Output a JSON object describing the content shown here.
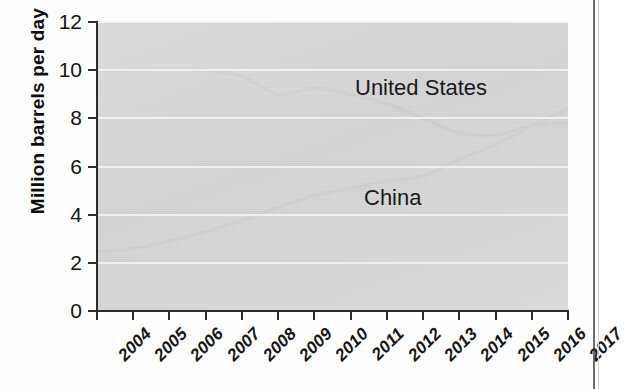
{
  "chart_data": {
    "type": "line",
    "title": "",
    "subtitle": "",
    "xlabel": "",
    "ylabel": "Million barrels per day",
    "categories": [
      "2004",
      "2005",
      "2006",
      "2007",
      "2008",
      "2009",
      "2010",
      "2011",
      "2012",
      "2013",
      "2014",
      "2015",
      "2016",
      "2017"
    ],
    "x": [
      2004,
      2005,
      2006,
      2007,
      2008,
      2009,
      2010,
      2011,
      2012,
      2013,
      2014,
      2015,
      2016,
      2017
    ],
    "xlim": [
      2004,
      2017
    ],
    "ylim": [
      0,
      12
    ],
    "yticks": [
      0,
      2,
      4,
      6,
      8,
      10,
      12
    ],
    "grid": "horizontal",
    "legend_position": "inline-annotation",
    "series": [
      {
        "name": "United States",
        "color": "#6e6e6e",
        "values": [
          10.0,
          10.0,
          10.05,
          10.0,
          9.75,
          9.0,
          9.25,
          9.0,
          8.6,
          8.0,
          7.4,
          7.3,
          7.7,
          7.8
        ]
      },
      {
        "name": "China",
        "color": "#6e6e6e",
        "values": [
          2.45,
          2.6,
          2.9,
          3.3,
          3.75,
          4.3,
          4.8,
          5.1,
          5.4,
          5.6,
          6.3,
          6.9,
          7.7,
          8.4
        ]
      }
    ],
    "annotations": [
      {
        "text": "United States",
        "x": 2011.1,
        "y": 9.6
      },
      {
        "text": "China",
        "x": 2011.4,
        "y": 4.7
      }
    ]
  },
  "axis": {
    "y_title": "Million barrels per day",
    "y_tick_labels": [
      "0",
      "2",
      "4",
      "6",
      "8",
      "10",
      "12"
    ],
    "x_tick_labels": [
      "2004",
      "2005",
      "2006",
      "2007",
      "2008",
      "2009",
      "2010",
      "2011",
      "2012",
      "2013",
      "2014",
      "2015",
      "2016",
      "2017"
    ]
  },
  "labels": {
    "united_states": "United States",
    "china": "China"
  },
  "colors": {
    "plot_background": "#d9d9d9",
    "line": "#6e6e6e",
    "axis": "#2b2b2b",
    "gridline": "#f3f3f3",
    "text": "#141414"
  }
}
